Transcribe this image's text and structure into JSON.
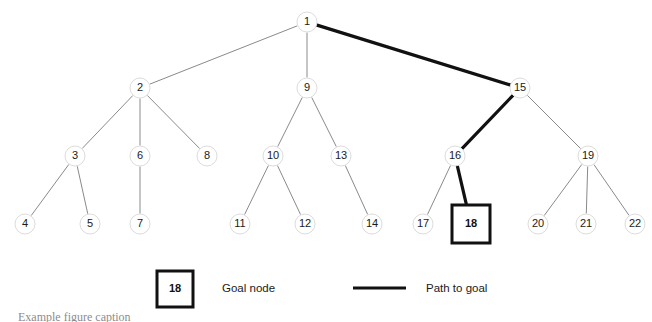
{
  "figure": {
    "title_sliver": "Example figure caption",
    "background_color": "#ffffff"
  },
  "colors": {
    "node_stroke": "#dcdcdc",
    "node_fill": "#ffffff",
    "edge_normal": "#8a8a8a",
    "edge_path": "#111111",
    "goal_box_stroke": "#111111",
    "text": "#1a1a1a"
  },
  "tree": {
    "type": "search-tree",
    "node_radius": 10,
    "nodes": [
      {
        "id": "1",
        "label": "1",
        "x": 307,
        "y": 22,
        "level": 0,
        "shape": "circle"
      },
      {
        "id": "2",
        "label": "2",
        "x": 140,
        "y": 88,
        "level": 1,
        "shape": "circle"
      },
      {
        "id": "9",
        "label": "9",
        "x": 307,
        "y": 88,
        "level": 1,
        "shape": "circle"
      },
      {
        "id": "15",
        "label": "15",
        "x": 520,
        "y": 88,
        "level": 1,
        "shape": "circle"
      },
      {
        "id": "3",
        "label": "3",
        "x": 75,
        "y": 156,
        "level": 2,
        "shape": "circle"
      },
      {
        "id": "6",
        "label": "6",
        "x": 140,
        "y": 156,
        "level": 2,
        "shape": "circle"
      },
      {
        "id": "8",
        "label": "8",
        "x": 207,
        "y": 156,
        "level": 2,
        "shape": "circle"
      },
      {
        "id": "10",
        "label": "10",
        "x": 273,
        "y": 156,
        "level": 2,
        "shape": "circle"
      },
      {
        "id": "13",
        "label": "13",
        "x": 341,
        "y": 156,
        "level": 2,
        "shape": "circle"
      },
      {
        "id": "16",
        "label": "16",
        "x": 455,
        "y": 156,
        "level": 2,
        "shape": "circle"
      },
      {
        "id": "19",
        "label": "19",
        "x": 588,
        "y": 156,
        "level": 2,
        "shape": "circle"
      },
      {
        "id": "4",
        "label": "4",
        "x": 25,
        "y": 224,
        "level": 3,
        "shape": "circle"
      },
      {
        "id": "5",
        "label": "5",
        "x": 90,
        "y": 224,
        "level": 3,
        "shape": "circle"
      },
      {
        "id": "7",
        "label": "7",
        "x": 140,
        "y": 224,
        "level": 3,
        "shape": "circle"
      },
      {
        "id": "11",
        "label": "11",
        "x": 240,
        "y": 224,
        "level": 3,
        "shape": "circle"
      },
      {
        "id": "12",
        "label": "12",
        "x": 305,
        "y": 224,
        "level": 3,
        "shape": "circle"
      },
      {
        "id": "14",
        "label": "14",
        "x": 372,
        "y": 224,
        "level": 3,
        "shape": "circle"
      },
      {
        "id": "17",
        "label": "17",
        "x": 423,
        "y": 224,
        "level": 3,
        "shape": "circle"
      },
      {
        "id": "18",
        "label": "18",
        "x": 471,
        "y": 224,
        "level": 3,
        "shape": "square",
        "goal": true
      },
      {
        "id": "20",
        "label": "20",
        "x": 538,
        "y": 224,
        "level": 3,
        "shape": "circle"
      },
      {
        "id": "21",
        "label": "21",
        "x": 586,
        "y": 224,
        "level": 3,
        "shape": "circle"
      },
      {
        "id": "22",
        "label": "22",
        "x": 635,
        "y": 224,
        "level": 3,
        "shape": "circle"
      }
    ],
    "edges": [
      {
        "from": "1",
        "to": "2",
        "highlighted": false
      },
      {
        "from": "1",
        "to": "9",
        "highlighted": false
      },
      {
        "from": "1",
        "to": "15",
        "highlighted": true
      },
      {
        "from": "2",
        "to": "3",
        "highlighted": false
      },
      {
        "from": "2",
        "to": "6",
        "highlighted": false
      },
      {
        "from": "2",
        "to": "8",
        "highlighted": false
      },
      {
        "from": "9",
        "to": "10",
        "highlighted": false
      },
      {
        "from": "9",
        "to": "13",
        "highlighted": false
      },
      {
        "from": "15",
        "to": "16",
        "highlighted": true
      },
      {
        "from": "15",
        "to": "19",
        "highlighted": false
      },
      {
        "from": "3",
        "to": "4",
        "highlighted": false
      },
      {
        "from": "3",
        "to": "5",
        "highlighted": false
      },
      {
        "from": "6",
        "to": "7",
        "highlighted": false
      },
      {
        "from": "10",
        "to": "11",
        "highlighted": false
      },
      {
        "from": "10",
        "to": "12",
        "highlighted": false
      },
      {
        "from": "13",
        "to": "14",
        "highlighted": false
      },
      {
        "from": "16",
        "to": "17",
        "highlighted": false
      },
      {
        "from": "16",
        "to": "18",
        "highlighted": true
      },
      {
        "from": "19",
        "to": "20",
        "highlighted": false
      },
      {
        "from": "19",
        "to": "21",
        "highlighted": false
      },
      {
        "from": "19",
        "to": "22",
        "highlighted": false
      }
    ],
    "goal_node_id": "18",
    "path_to_goal": [
      "1",
      "15",
      "16",
      "18"
    ]
  },
  "legend": {
    "goal": {
      "sample_label": "18",
      "text": "Goal node",
      "box": {
        "x": 157,
        "y": 271,
        "size": 36
      },
      "text_x": 222,
      "text_y": 289
    },
    "path": {
      "text": "Path to goal",
      "line": {
        "x1": 353,
        "x2": 406,
        "y": 288
      },
      "text_x": 426,
      "text_y": 289
    }
  }
}
